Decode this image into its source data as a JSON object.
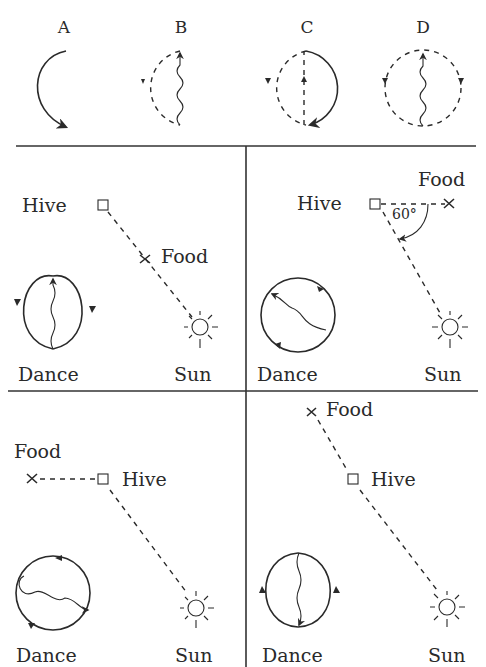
{
  "figure": {
    "top_row": {
      "panels": [
        {
          "label": "A",
          "description": "Solid half-circle arc turning right with arrow at bottom"
        },
        {
          "label": "B",
          "description": "Dashed left semicircle with waggle run upward"
        },
        {
          "label": "C",
          "description": "Dashed left half and solid right half with dashed center line"
        },
        {
          "label": "D",
          "description": "Dashed full circle with waggle run upward, arrows on both sides"
        }
      ]
    },
    "quadrants": [
      {
        "id": "top-left",
        "hive_label": "Hive",
        "food_label": "Food",
        "sun_label": "Sun",
        "dance_label": "Dance",
        "note": "Food directly toward the sun; waggle run straight up"
      },
      {
        "id": "top-right",
        "hive_label": "Hive",
        "food_label": "Food",
        "sun_label": "Sun",
        "dance_label": "Dance",
        "angle_label": "60°",
        "note": "Food 60° left of sun direction; waggle run tilted"
      },
      {
        "id": "bottom-left",
        "hive_label": "Hive",
        "food_label": "Food",
        "sun_label": "Sun",
        "dance_label": "Dance",
        "note": "Food to the left, perpendicular-ish to sun; waggle run tilted"
      },
      {
        "id": "bottom-right",
        "hive_label": "Hive",
        "food_label": "Food",
        "sun_label": "Sun",
        "dance_label": "Dance",
        "note": "Food directly away from sun; waggle run straight down"
      }
    ]
  }
}
